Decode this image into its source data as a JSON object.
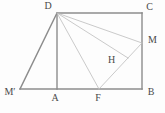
{
  "diagram": {
    "canvas": {
      "width": 165,
      "height": 113,
      "background": "#fdfdfd"
    },
    "colors": {
      "outer_stroke": "#8c8c8c",
      "inner_stroke": "#bcbcbc",
      "label_color": "#4a4a4a"
    },
    "points": {
      "D": {
        "x": 57,
        "y": 13
      },
      "C": {
        "x": 142,
        "y": 13
      },
      "B": {
        "x": 142,
        "y": 89
      },
      "A": {
        "x": 57,
        "y": 89
      },
      "Mp": {
        "x": 20,
        "y": 89
      },
      "F": {
        "x": 99,
        "y": 89
      },
      "M": {
        "x": 142,
        "y": 43
      },
      "H": {
        "x": 128,
        "y": 58
      }
    },
    "segments": [
      {
        "name": "edge-D-C",
        "from": "D",
        "to": "C",
        "kind": "outer"
      },
      {
        "name": "edge-C-B",
        "from": "C",
        "to": "B",
        "kind": "outer"
      },
      {
        "name": "edge-Mp-B",
        "from": "Mp",
        "to": "B",
        "kind": "outer"
      },
      {
        "name": "edge-D-Mp",
        "from": "D",
        "to": "Mp",
        "kind": "outer"
      },
      {
        "name": "segment-D-A",
        "from": "D",
        "to": "A",
        "kind": "outer"
      },
      {
        "name": "segment-D-F",
        "from": "D",
        "to": "F",
        "kind": "inner"
      },
      {
        "name": "segment-D-H",
        "from": "D",
        "to": "H",
        "kind": "inner"
      },
      {
        "name": "segment-D-M",
        "from": "D",
        "to": "M",
        "kind": "inner"
      },
      {
        "name": "segment-F-M",
        "from": "F",
        "to": "M",
        "kind": "inner"
      }
    ],
    "labels": [
      {
        "name": "label-D",
        "text": "D",
        "x": 48,
        "y": 7
      },
      {
        "name": "label-C",
        "text": "C",
        "x": 149.5,
        "y": 8
      },
      {
        "name": "label-M",
        "text": "M",
        "x": 152.5,
        "y": 40.5
      },
      {
        "name": "label-H",
        "text": "H",
        "x": 111.5,
        "y": 60.5
      },
      {
        "name": "label-M-prime",
        "text": "M′",
        "x": 10,
        "y": 92.5
      },
      {
        "name": "label-A",
        "text": "A",
        "x": 55,
        "y": 98.5
      },
      {
        "name": "label-F",
        "text": "F",
        "x": 98,
        "y": 98.5
      },
      {
        "name": "label-B",
        "text": "B",
        "x": 151,
        "y": 92.5
      }
    ]
  }
}
